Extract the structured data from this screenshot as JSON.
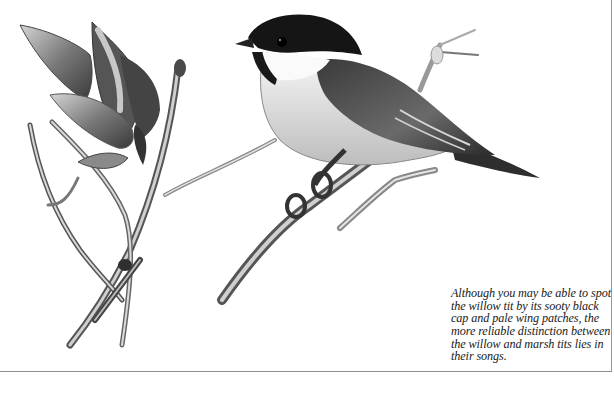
{
  "illustration": {
    "subject": "willow tit perched on a branch",
    "style": "monochrome painted illustration"
  },
  "caption": {
    "text": "Although you may be able to spot the willow tit by its sooty black cap and pale wing patches, the more reliable distinction between the willow and marsh tits lies in their songs."
  },
  "colors": {
    "background": "#ffffff",
    "ink": "#1a1a1a",
    "border": "#9a9a9a"
  }
}
